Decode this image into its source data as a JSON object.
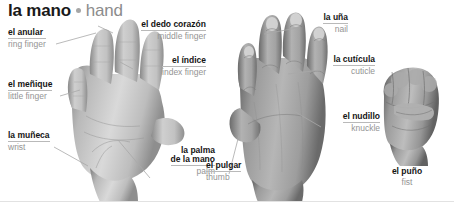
{
  "title": {
    "spanish": "la mano",
    "english": "hand",
    "separator_icon": "bullet-dot"
  },
  "colors": {
    "heading_spanish": "#1a1a1a",
    "heading_english": "#8c8c8c",
    "label_spanish": "#141414",
    "label_english": "#949494",
    "leader_line": "#a8a8a8",
    "underline": "#b9b9b9",
    "background": "#ffffff",
    "border": "#e2e2e2"
  },
  "figures": [
    {
      "id": "palm-hand",
      "name": "open-hand-palm-view",
      "caption": null
    },
    {
      "id": "back-hand",
      "name": "open-hand-back-view",
      "caption": null
    },
    {
      "id": "fist-hand",
      "name": "closed-hand-fist-view",
      "caption": "el puño"
    }
  ],
  "labels": [
    {
      "id": "anular",
      "spanish": "el anular",
      "english": "ring finger",
      "align": "left",
      "figure": "palm-hand"
    },
    {
      "id": "dedo-corazon",
      "spanish": "el dedo corazón",
      "english": "middle finger",
      "align": "right",
      "figure": "palm-hand"
    },
    {
      "id": "indice",
      "spanish": "el índice",
      "english": "index finger",
      "align": "right",
      "figure": "palm-hand"
    },
    {
      "id": "menique",
      "spanish": "el meñique",
      "english": "little finger",
      "align": "left",
      "figure": "palm-hand"
    },
    {
      "id": "muneca",
      "spanish": "la muñeca",
      "english": "wrist",
      "align": "left",
      "figure": "palm-hand"
    },
    {
      "id": "palma",
      "spanish": "la palma\nde la mano",
      "spanish_line1": "la palma",
      "spanish_line2": "de la mano",
      "english": "palm",
      "align": "right",
      "figure": "palm-hand"
    },
    {
      "id": "pulgar",
      "spanish": "el pulgar",
      "english": "thumb",
      "align": "left",
      "figure": "back-hand"
    },
    {
      "id": "una",
      "spanish": "la uña",
      "english": "nail",
      "align": "right",
      "figure": "back-hand"
    },
    {
      "id": "cuticula",
      "spanish": "la cutícula",
      "english": "cuticle",
      "align": "right",
      "figure": "back-hand"
    },
    {
      "id": "nudillo",
      "spanish": "el nudillo",
      "english": "knuckle",
      "align": "right",
      "figure": "back-hand"
    },
    {
      "id": "puno",
      "spanish": "el puño",
      "english": "fist",
      "align": "center",
      "figure": "fist-hand"
    }
  ]
}
